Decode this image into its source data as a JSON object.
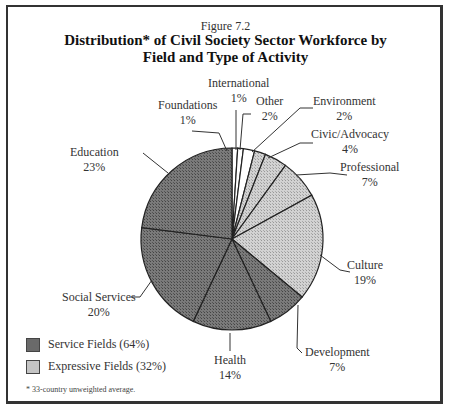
{
  "figure": {
    "number": "Figure 7.2",
    "title_line1": "Distribution* of Civil Society Sector Workforce by",
    "title_line2": "Field and Type of Activity",
    "footnote": "* 33-country unweighted average."
  },
  "legend": [
    {
      "label": "Service Fields (64%)",
      "type": "service",
      "color": "#6a6a6a"
    },
    {
      "label": "Expressive Fields (32%)",
      "type": "expressive",
      "color": "#c4c4c4"
    }
  ],
  "labels": {
    "foundations": {
      "name": "Foundations",
      "pct": "1%"
    },
    "international": {
      "name": "International",
      "pct": "1%"
    },
    "other": {
      "name": "Other",
      "pct": "2%"
    },
    "environment": {
      "name": "Environment",
      "pct": "2%"
    },
    "civic": {
      "name": "Civic/Advocacy",
      "pct": "4%"
    },
    "professional": {
      "name": "Professional",
      "pct": "7%"
    },
    "culture": {
      "name": "Culture",
      "pct": "19%"
    },
    "development": {
      "name": "Development",
      "pct": "7%"
    },
    "health": {
      "name": "Health",
      "pct": "14%"
    },
    "social": {
      "name": "Social Services",
      "pct": "20%"
    },
    "education": {
      "name": "Education",
      "pct": "23%"
    }
  },
  "chart_data": {
    "type": "pie",
    "title": "Distribution* of Civil Society Sector Workforce by Field and Type of Activity",
    "subtitle": "Figure 7.2",
    "start_angle": "12 o'clock, clockwise",
    "categories": [
      "Foundations",
      "International",
      "Other",
      "Environment",
      "Civic/Advocacy",
      "Professional",
      "Culture",
      "Development",
      "Health",
      "Social Services",
      "Education"
    ],
    "values": [
      1,
      1,
      2,
      2,
      4,
      7,
      19,
      7,
      14,
      20,
      23
    ],
    "groups": [
      "other",
      "other",
      "other",
      "expressive",
      "expressive",
      "expressive",
      "expressive",
      "service",
      "service",
      "service",
      "service"
    ],
    "legend": [
      "Service Fields (64%)",
      "Expressive Fields (32%)"
    ],
    "legend_position": "bottom-left",
    "colors": {
      "service": "#6a6a6a",
      "expressive": "#c4c4c4",
      "other": "#ffffff"
    },
    "annotation": "* 33-country unweighted average."
  }
}
